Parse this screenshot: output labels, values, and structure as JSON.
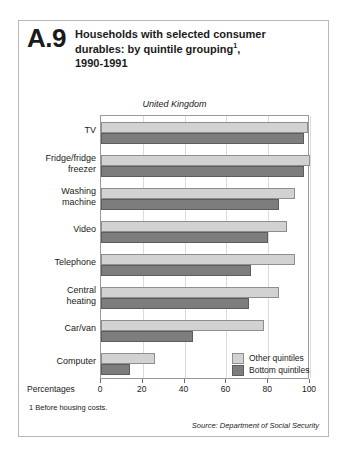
{
  "figure": {
    "number": "A.9",
    "title_line1": "Households with selected consumer",
    "title_line2": "durables: by quintile grouping",
    "title_superscript": "1",
    "title_line2_tail": ",",
    "title_line3": "1990-1991",
    "region": "United Kingdom",
    "axis_name": "Percentages",
    "footnote": "1  Before housing costs.",
    "source": "Source:  Department of Social Security"
  },
  "colors": {
    "other_quintiles": "#d2d2d2",
    "bottom_quintiles": "#7d7d7d",
    "border": "#8e8e8e",
    "frame": "#b8b8b8",
    "gridline": "#dcdcdc"
  },
  "chart_data": {
    "type": "bar",
    "orientation": "horizontal",
    "subtitle": "United Kingdom",
    "xlabel": "Percentages",
    "ylabel": "",
    "xlim": [
      0,
      100
    ],
    "xticks": [
      0,
      20,
      40,
      60,
      80,
      100
    ],
    "xtick_labels": [
      "0",
      "20",
      "40",
      "60",
      "80",
      "100"
    ],
    "grid": true,
    "legend_position": "inside-bottom-right",
    "categories": [
      "TV",
      "Fridge/fridge freezer",
      "Washing machine",
      "Video",
      "Telephone",
      "Central heating",
      "Car/van",
      "Computer"
    ],
    "category_lines": [
      [
        "TV"
      ],
      [
        "Fridge/fridge",
        "freezer"
      ],
      [
        "Washing",
        "machine"
      ],
      [
        "Video"
      ],
      [
        "Telephone"
      ],
      [
        "Central",
        "heating"
      ],
      [
        "Car/van"
      ],
      [
        "Computer"
      ]
    ],
    "series": [
      {
        "name": "Other quintiles",
        "color": "#d2d2d2",
        "values": [
          99,
          100,
          93,
          89,
          93,
          85,
          78,
          26
        ]
      },
      {
        "name": "Bottom quintiles",
        "color": "#7d7d7d",
        "values": [
          97,
          97,
          85,
          80,
          72,
          71,
          44,
          14
        ]
      }
    ]
  }
}
